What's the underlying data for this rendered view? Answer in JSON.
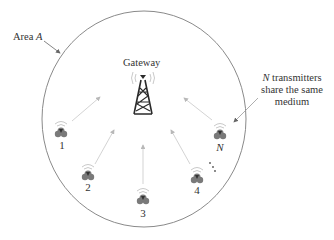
{
  "area": {
    "label_prefix": "Area ",
    "label_var": "A"
  },
  "gateway": {
    "label": "Gateway"
  },
  "note": {
    "var": "N",
    "line1_rest": " transmitters",
    "line2": "share the same",
    "line3": "medium"
  },
  "transmitters": [
    {
      "label": "1"
    },
    {
      "label": "2"
    },
    {
      "label": "3"
    },
    {
      "label": "4"
    },
    {
      "label": "N"
    }
  ],
  "ellipsis": "⋮",
  "colors": {
    "circle": "#8a8a8a",
    "arrow": "#c8c8c8",
    "icon": "#7a7a7a",
    "tower": "#2a2a2a"
  }
}
